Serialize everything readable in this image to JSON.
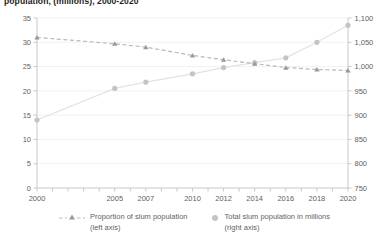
{
  "title": "population, (millions), 2000-2020",
  "colors": {
    "proportion_line": "#b9b9b9",
    "proportion_marker": "#9a9a9a",
    "total_dots": "#c4c4c4",
    "total_trend": "#e2e2e2",
    "axis": "#c8c8c8",
    "grid": "#ededed",
    "text": "#5f5f5f",
    "title": "#1c1c1c"
  },
  "legend": {
    "items": [
      {
        "marker": "dashed-line-triangle-marker",
        "label_line1": "Proportion of slum population",
        "label_line2": "(left axis)"
      },
      {
        "marker": "dot-marker",
        "label_line1": "Total slum population in millions",
        "label_line2": "(right axis)"
      }
    ]
  },
  "chart_data": {
    "type": "line",
    "title": "population, (millions), 2000-2020",
    "xlabel": "",
    "ylabel": "",
    "grid": true,
    "legend_position": "bottom",
    "x": [
      2000,
      2005,
      2007,
      2010,
      2012,
      2014,
      2016,
      2018,
      2020
    ],
    "tick_labels_x": [
      "2000",
      "2005",
      "2007",
      "2010",
      "2012",
      "2014",
      "2016",
      "2018",
      "2020"
    ],
    "x_range": [
      2000,
      2020
    ],
    "left_axis": {
      "ticks": [
        0,
        5,
        10,
        15,
        20,
        25,
        30,
        35
      ],
      "tick_labels": [
        "0",
        "5",
        "10",
        "15",
        "20",
        "25",
        "30",
        "35"
      ],
      "ylim": [
        0,
        35
      ]
    },
    "right_axis": {
      "ticks": [
        750,
        800,
        850,
        900,
        950,
        1000,
        1050,
        1100
      ],
      "tick_labels": [
        "750",
        "800",
        "850",
        "900",
        "950",
        "1,000",
        "1,050",
        "1,100"
      ],
      "ylim": [
        750,
        1100
      ]
    },
    "series": [
      {
        "name": "Proportion of slum population (left axis)",
        "axis": "left",
        "style": "dashed-line-with-triangles",
        "values": [
          31.0,
          29.7,
          29.0,
          27.3,
          26.4,
          25.6,
          24.8,
          24.4,
          24.2
        ]
      },
      {
        "name": "Total slum population in millions (right axis)",
        "axis": "right",
        "style": "dots-with-faint-trend",
        "values": [
          890,
          955,
          968,
          985,
          998,
          1008,
          1018,
          1050,
          1085
        ]
      }
    ]
  }
}
